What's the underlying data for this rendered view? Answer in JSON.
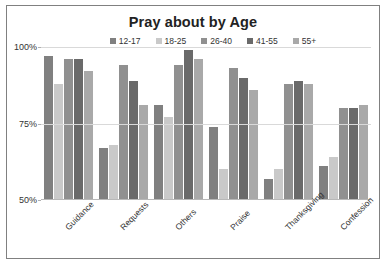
{
  "chart_data": {
    "type": "bar",
    "title": "Pray about by Age",
    "xlabel": "",
    "ylabel": "",
    "ylim": [
      50,
      100
    ],
    "yticks": [
      50,
      75,
      100
    ],
    "ytick_labels": [
      "50%",
      "75%",
      "100%"
    ],
    "grid": true,
    "legend_position": "top",
    "categories": [
      "Guidance",
      "Requests",
      "Others",
      "Praise",
      "Thanksgiving",
      "Confession"
    ],
    "series": [
      {
        "name": "12-17",
        "color": "#808080",
        "values": [
          97,
          67,
          81,
          74,
          57,
          61
        ]
      },
      {
        "name": "18-25",
        "color": "#c9c9c9",
        "values": [
          88,
          68,
          77,
          60,
          60,
          64
        ]
      },
      {
        "name": "26-40",
        "color": "#909090",
        "values": [
          96,
          94,
          94,
          93,
          88,
          80
        ]
      },
      {
        "name": "41-55",
        "color": "#6a6a6a",
        "values": [
          96,
          89,
          99,
          90,
          89,
          80
        ]
      },
      {
        "name": "55+",
        "color": "#a9a9a9",
        "values": [
          92,
          81,
          96,
          86,
          88,
          81
        ]
      }
    ]
  },
  "colors": {
    "frame_border": "#808080",
    "gridline": "#d9d9d9",
    "text": "#333333",
    "title": "#222222",
    "background": "#ffffff"
  }
}
